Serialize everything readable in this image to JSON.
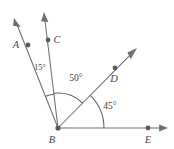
{
  "figure": {
    "kind": "angle-diagram",
    "background_color": "#ffffff",
    "stroke_color": "#6e6e73",
    "label_color": "#46464a",
    "width": 174,
    "height": 149
  },
  "vertex": {
    "name": "B",
    "label": "B",
    "x": 58,
    "y": 128
  },
  "points": [
    {
      "id": "A",
      "label": "A",
      "dot_x": 28,
      "dot_y": 45,
      "label_x": 18,
      "label_y": 48
    },
    {
      "id": "C",
      "label": "C",
      "dot_x": 48,
      "dot_y": 40,
      "label_x": 54,
      "label_y": 43
    },
    {
      "id": "D",
      "label": "D",
      "dot_x": 115,
      "dot_y": 68,
      "label_x": 112,
      "label_y": 82
    },
    {
      "id": "E",
      "label": "E",
      "dot_x": 148,
      "dot_y": 128,
      "label_x": 145,
      "label_y": 142
    },
    {
      "id": "B",
      "label": "B",
      "dot_x": 58,
      "dot_y": 128,
      "label_x": 49,
      "label_y": 142
    }
  ],
  "rays": [
    {
      "id": "ray-BA",
      "through": "A",
      "from_x": 58,
      "from_y": 128,
      "to_x": 14,
      "to_y": 18,
      "has_arrowhead": true
    },
    {
      "id": "ray-BC",
      "through": "C",
      "from_x": 58,
      "from_y": 128,
      "to_x": 44,
      "to_y": 12,
      "has_arrowhead": true
    },
    {
      "id": "ray-BD",
      "through": "D",
      "from_x": 58,
      "from_y": 128,
      "to_x": 137,
      "to_y": 48,
      "has_arrowhead": true
    },
    {
      "id": "ray-BE",
      "through": "E",
      "from_x": 58,
      "from_y": 128,
      "to_x": 168,
      "to_y": 128,
      "has_arrowhead": true
    }
  ],
  "angles": [
    {
      "id": "angle-ABC",
      "measure": "15°",
      "value": 15,
      "unit": "degrees",
      "between": [
        "A",
        "C"
      ],
      "label_x": 31,
      "label_y": 67,
      "arc_radius": 34
    },
    {
      "id": "angle-CBD",
      "measure": "50°",
      "value": 50,
      "unit": "degrees",
      "between": [
        "C",
        "D"
      ],
      "label_x": 67,
      "label_y": 80,
      "arc_radius": 35
    },
    {
      "id": "angle-DBE",
      "measure": "45°",
      "value": 45,
      "unit": "degrees",
      "between": [
        "D",
        "E"
      ],
      "label_x": 100,
      "label_y": 108,
      "arc_radius": 46
    }
  ]
}
